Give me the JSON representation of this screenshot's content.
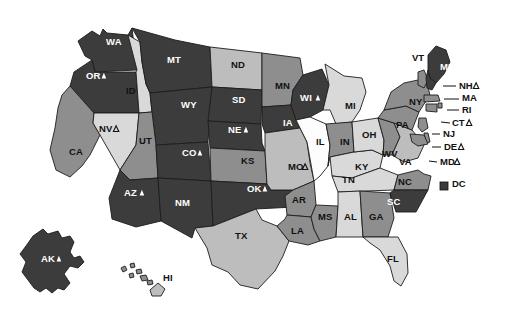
{
  "figure": {
    "type": "choropleth-map",
    "region": "United States",
    "background": "#ffffff",
    "insets": [
      "AK",
      "HI"
    ],
    "legend_marker": {
      "label": "DC",
      "marker": "filled-square",
      "color": "#3a3a3a"
    }
  },
  "palette": {
    "very_dark": "#3c3c3c",
    "dark": "#4f4f4f",
    "medium": "#8e8e8e",
    "light": "#bdbdbd",
    "very_light": "#d9d9d9",
    "white": "#fdfdfd",
    "outline": "#1c1c1c",
    "label_on_dark": "#ffffff",
    "label_on_light": "#111111"
  },
  "symbols": {
    "filled_triangle": "▲",
    "open_triangle": "△",
    "filled_square": "■"
  },
  "chart_data": {
    "type": "heatmap",
    "title": "",
    "xlabel": "",
    "ylabel": "",
    "legend_position": "right-inline",
    "categories": [
      "AL",
      "AK",
      "AZ",
      "AR",
      "CA",
      "CO",
      "CT",
      "DE",
      "DC",
      "FL",
      "GA",
      "HI",
      "ID",
      "IL",
      "IN",
      "IA",
      "KS",
      "KY",
      "LA",
      "ME",
      "MD",
      "MA",
      "MI",
      "MN",
      "MS",
      "MO",
      "MT",
      "NE",
      "NV",
      "NH",
      "NJ",
      "NM",
      "NY",
      "NC",
      "ND",
      "OH",
      "OK",
      "OR",
      "PA",
      "RI",
      "SC",
      "SD",
      "TN",
      "TX",
      "UT",
      "VT",
      "VA",
      "WA",
      "WV",
      "WI",
      "WY"
    ],
    "series": [
      {
        "name": "shade_level",
        "values": [
          2,
          5,
          5,
          3,
          3,
          5,
          3,
          3,
          5,
          2,
          3,
          2,
          1,
          0,
          4,
          5,
          3,
          2,
          3,
          5,
          3,
          3,
          2,
          3,
          3,
          2,
          5,
          5,
          1,
          3,
          3,
          5,
          3,
          4,
          3,
          2,
          5,
          5,
          3,
          3,
          5,
          5,
          2,
          2,
          3,
          3,
          3,
          5,
          3,
          5,
          5
        ]
      },
      {
        "name": "marker",
        "values": [
          "",
          "filled",
          "filled",
          "",
          "",
          "filled",
          "open",
          "open",
          "square",
          "",
          "",
          "",
          "",
          "",
          "",
          "",
          "",
          "",
          "",
          "filled",
          "open",
          "",
          "",
          "",
          "",
          "open",
          "",
          "filled",
          "open",
          "open",
          "",
          "",
          "",
          "",
          "",
          "",
          "filled",
          "filled",
          "",
          "",
          "",
          "",
          "",
          "",
          "",
          "",
          "",
          "",
          "",
          "filled",
          ""
        ]
      }
    ]
  },
  "states": [
    {
      "code": "AK",
      "shade": "very_dark",
      "marker": "filled",
      "label_x": 41,
      "label_y": 262
    },
    {
      "code": "HI",
      "shade": "light",
      "marker": "",
      "label_x": 163,
      "label_y": 281
    },
    {
      "code": "WA",
      "shade": "very_dark",
      "marker": "",
      "label_x": 106,
      "label_y": 45
    },
    {
      "code": "OR",
      "shade": "very_dark",
      "marker": "filled",
      "label_x": 86,
      "label_y": 79
    },
    {
      "code": "CA",
      "shade": "medium",
      "marker": "",
      "label_x": 69,
      "label_y": 155
    },
    {
      "code": "NV",
      "shade": "very_light",
      "marker": "open",
      "label_x": 99,
      "label_y": 132
    },
    {
      "code": "ID",
      "shade": "very_light",
      "marker": "",
      "label_x": 126,
      "label_y": 94
    },
    {
      "code": "MT",
      "shade": "very_dark",
      "marker": "",
      "label_x": 167,
      "label_y": 63
    },
    {
      "code": "WY",
      "shade": "very_dark",
      "marker": "",
      "label_x": 181,
      "label_y": 108
    },
    {
      "code": "UT",
      "shade": "medium",
      "marker": "",
      "label_x": 139,
      "label_y": 144
    },
    {
      "code": "AZ",
      "shade": "very_dark",
      "marker": "filled",
      "label_x": 124,
      "label_y": 196
    },
    {
      "code": "CO",
      "shade": "very_dark",
      "marker": "filled",
      "label_x": 182,
      "label_y": 156
    },
    {
      "code": "NM",
      "shade": "very_dark",
      "marker": "",
      "label_x": 175,
      "label_y": 206
    },
    {
      "code": "ND",
      "shade": "light",
      "marker": "",
      "label_x": 231,
      "label_y": 68
    },
    {
      "code": "SD",
      "shade": "very_dark",
      "marker": "",
      "label_x": 232,
      "label_y": 103
    },
    {
      "code": "NE",
      "shade": "very_dark",
      "marker": "filled",
      "label_x": 228,
      "label_y": 133
    },
    {
      "code": "KS",
      "shade": "medium",
      "marker": "",
      "label_x": 241,
      "label_y": 164
    },
    {
      "code": "OK",
      "shade": "very_dark",
      "marker": "filled",
      "label_x": 247,
      "label_y": 192
    },
    {
      "code": "TX",
      "shade": "light",
      "marker": "",
      "label_x": 235,
      "label_y": 239
    },
    {
      "code": "MN",
      "shade": "medium",
      "marker": "",
      "label_x": 275,
      "label_y": 89
    },
    {
      "code": "IA",
      "shade": "very_dark",
      "marker": "",
      "label_x": 283,
      "label_y": 126
    },
    {
      "code": "MO",
      "shade": "light",
      "marker": "open",
      "label_x": 288,
      "label_y": 170
    },
    {
      "code": "AR",
      "shade": "medium",
      "marker": "",
      "label_x": 292,
      "label_y": 203
    },
    {
      "code": "LA",
      "shade": "medium",
      "marker": "",
      "label_x": 291,
      "label_y": 234
    },
    {
      "code": "WI",
      "shade": "very_dark",
      "marker": "filled",
      "label_x": 300,
      "label_y": 101
    },
    {
      "code": "IL",
      "shade": "white",
      "marker": "",
      "label_x": 316,
      "label_y": 145
    },
    {
      "code": "MS",
      "shade": "medium",
      "marker": "",
      "label_x": 318,
      "label_y": 220
    },
    {
      "code": "MI",
      "shade": "very_light",
      "marker": "",
      "label_x": 345,
      "label_y": 109
    },
    {
      "code": "IN",
      "shade": "medium",
      "marker": "",
      "label_x": 340,
      "label_y": 145
    },
    {
      "code": "KY",
      "shade": "very_light",
      "marker": "",
      "label_x": 355,
      "label_y": 170
    },
    {
      "code": "TN",
      "shade": "very_light",
      "marker": "",
      "label_x": 342,
      "label_y": 183
    },
    {
      "code": "AL",
      "shade": "very_light",
      "marker": "",
      "label_x": 344,
      "label_y": 220
    },
    {
      "code": "OH",
      "shade": "very_light",
      "marker": "",
      "label_x": 362,
      "label_y": 138
    },
    {
      "code": "GA",
      "shade": "medium",
      "marker": "",
      "label_x": 369,
      "label_y": 220
    },
    {
      "code": "FL",
      "shade": "very_light",
      "marker": "",
      "label_x": 387,
      "label_y": 262
    },
    {
      "code": "WV",
      "shade": "medium",
      "marker": "",
      "label_x": 382,
      "label_y": 157
    },
    {
      "code": "VA",
      "shade": "light",
      "marker": "",
      "label_x": 399,
      "label_y": 165
    },
    {
      "code": "NC",
      "shade": "medium",
      "marker": "",
      "label_x": 398,
      "label_y": 185
    },
    {
      "code": "SC",
      "shade": "very_dark",
      "marker": "",
      "label_x": 387,
      "label_y": 205
    },
    {
      "code": "PA",
      "shade": "medium",
      "marker": "",
      "label_x": 396,
      "label_y": 128
    },
    {
      "code": "NY",
      "shade": "medium",
      "marker": "",
      "label_x": 409,
      "label_y": 105
    },
    {
      "code": "ME",
      "shade": "very_dark",
      "marker": "filled",
      "label_x": 440,
      "label_y": 70
    }
  ],
  "callouts": [
    {
      "code": "VT",
      "marker": "",
      "x": 412,
      "y": 61,
      "lead": null
    },
    {
      "code": "NH",
      "marker": "open",
      "x": 459,
      "y": 89,
      "lead": [
        [
          443,
          86
        ],
        [
          456,
          86
        ]
      ]
    },
    {
      "code": "MA",
      "marker": "",
      "x": 462,
      "y": 101,
      "lead": [
        [
          444,
          99
        ],
        [
          459,
          99
        ]
      ]
    },
    {
      "code": "RI",
      "marker": "",
      "x": 462,
      "y": 113,
      "lead": [
        [
          447,
          110
        ],
        [
          459,
          110
        ]
      ]
    },
    {
      "code": "CT",
      "marker": "open",
      "x": 452,
      "y": 126,
      "lead": [
        [
          441,
          122
        ],
        [
          450,
          123
        ]
      ]
    },
    {
      "code": "NJ",
      "marker": "",
      "x": 443,
      "y": 137,
      "lead": [
        [
          432,
          134
        ],
        [
          440,
          134
        ]
      ]
    },
    {
      "code": "DE",
      "marker": "open",
      "x": 444,
      "y": 150,
      "lead": [
        [
          432,
          147
        ],
        [
          441,
          147
        ]
      ]
    },
    {
      "code": "MD",
      "marker": "open",
      "x": 440,
      "y": 165,
      "lead": [
        [
          429,
          161
        ],
        [
          437,
          162
        ]
      ]
    }
  ],
  "legend": {
    "label": "DC",
    "x": 452,
    "y": 187,
    "marker_x": 440,
    "marker_y": 182
  }
}
